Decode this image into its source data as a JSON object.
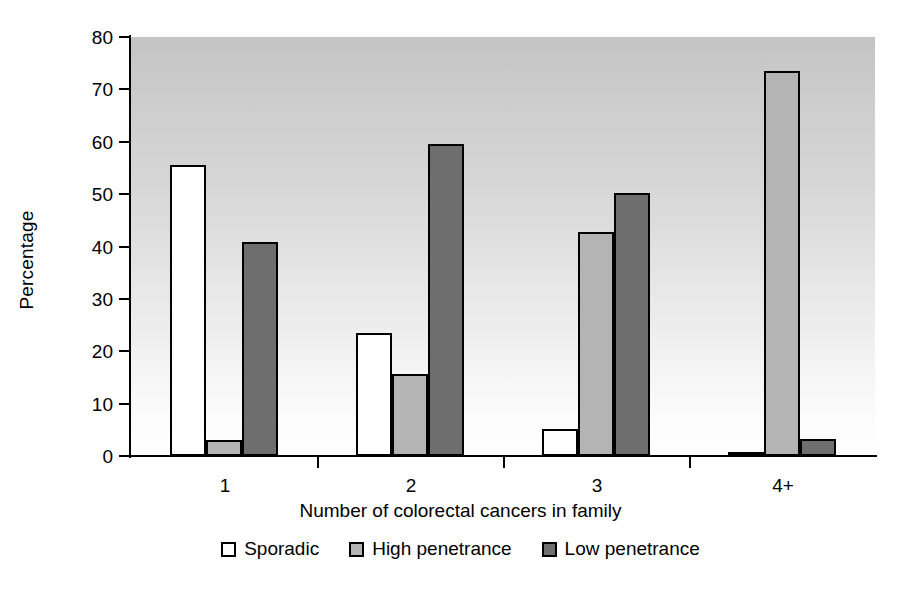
{
  "chart_data": {
    "type": "bar",
    "title": "",
    "xlabel": "Number of colorectal cancers in family",
    "ylabel": "Percentage",
    "categories": [
      "1",
      "2",
      "3",
      "4+"
    ],
    "series": [
      {
        "name": "Sporadic",
        "color": "#ffffff",
        "values": [
          55.5,
          23.5,
          5.2,
          0.4
        ]
      },
      {
        "name": "High penetrance",
        "color": "#b4b4b4",
        "values": [
          3.0,
          15.7,
          42.8,
          73.5
        ]
      },
      {
        "name": "Low penetrance",
        "color": "#6e6e6e",
        "values": [
          40.8,
          59.5,
          50.2,
          3.2
        ]
      }
    ],
    "ylim": [
      0,
      80
    ],
    "yticks": [
      "0",
      "10",
      "20",
      "30",
      "40",
      "50",
      "60",
      "70",
      "80"
    ],
    "grid": false,
    "legend_position": "bottom",
    "plot_background": "vertical gradient grey to white",
    "bar_border_color": "#000000"
  },
  "axes": {
    "y_title": "Percentage",
    "x_title": "Number of colorectal cancers in family"
  },
  "legend": {
    "items": [
      {
        "label": "Sporadic",
        "swatch": "sporadic"
      },
      {
        "label": "High penetrance",
        "swatch": "high"
      },
      {
        "label": "Low penetrance",
        "swatch": "low"
      }
    ]
  }
}
